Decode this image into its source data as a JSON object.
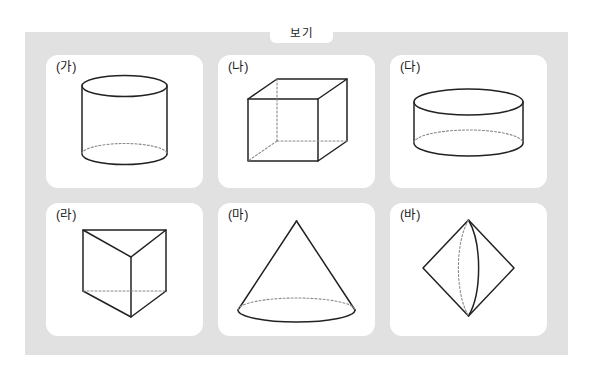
{
  "panel": {
    "tab_label": "보기",
    "background_color": "#e1e1e1",
    "card_background_color": "#ffffff",
    "stroke_color": "#222222",
    "hidden_edge_color": "#8a8a8a"
  },
  "cards": [
    {
      "label": "(가)",
      "shape": "cylinder-tall",
      "shape_name": "원기둥 (tall cylinder)",
      "icon": "cylinder-icon"
    },
    {
      "label": "(나)",
      "shape": "cube",
      "shape_name": "정육면체 (cube wireframe)",
      "icon": "cube-icon"
    },
    {
      "label": "(다)",
      "shape": "cylinder-short",
      "shape_name": "원기둥 (short wide cylinder)",
      "icon": "cylinder-icon"
    },
    {
      "label": "(라)",
      "shape": "triangular-prism",
      "shape_name": "삼각기둥 (triangular prism)",
      "icon": "prism-icon"
    },
    {
      "label": "(마)",
      "shape": "cone",
      "shape_name": "원뿔 (cone)",
      "icon": "cone-icon"
    },
    {
      "label": "(바)",
      "shape": "bicone",
      "shape_name": "쌍원뿔 (double cone / bicone)",
      "icon": "bicone-icon"
    }
  ]
}
